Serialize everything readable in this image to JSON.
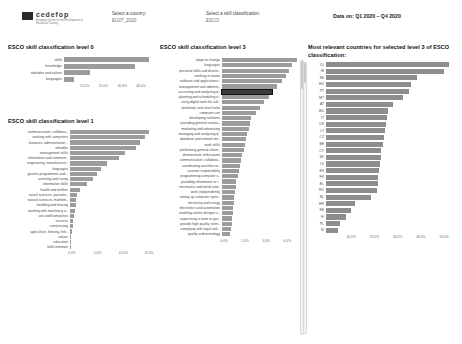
{
  "header": {
    "logo_word": "cedefop",
    "logo_sub": "European Centre for the Development of Vocational Training",
    "country_select": {
      "label": "Select a country:",
      "value": "EU27_2020"
    },
    "class_select": {
      "label": "Select a skill classification:",
      "value": "ESCO"
    },
    "data_on": "Data on: Q1 2020 – Q4 2020"
  },
  "panels": {
    "level0_title": "ESCO skill classification level 0",
    "level1_title": "ESCO skill classification level 1",
    "level3_title": "ESCO skill classification level 3",
    "countries_title": "Most relevant countries for selected level 3 of ESCO classification:"
  },
  "chart_data": [
    {
      "id": "level0",
      "type": "bar",
      "orientation": "horizontal",
      "title": "ESCO skill classification level 0",
      "xlabel": "",
      "ylabel": "",
      "xlim": [
        0,
        47
      ],
      "grid": false,
      "ticks": [
        "10.0%",
        "20.0%",
        "30.0%",
        "40.0%"
      ],
      "tick_values": [
        10,
        20,
        30,
        40
      ],
      "categories": [
        "skills",
        "knowledge",
        "attitudes and values",
        "languages"
      ],
      "values": [
        44.5,
        37.0,
        13.5,
        5.0
      ]
    },
    {
      "id": "level1",
      "type": "bar",
      "orientation": "horizontal",
      "title": "ESCO skill classification level 1",
      "xlabel": "",
      "ylabel": "",
      "xlim": [
        0,
        16
      ],
      "grid": false,
      "ticks": [
        "0.0%",
        "5.0%",
        "10.0%",
        "15.0%"
      ],
      "tick_values": [
        0,
        5,
        10,
        15
      ],
      "categories": [
        "communication, collabora..",
        "working with computers",
        "business, administration ..",
        "attitudes",
        "management skills",
        "information and communi..",
        "engineering, manufacturin..",
        "languages",
        "generic programmes and ..",
        "assisting and caring",
        "information skills",
        "health and welfare",
        "social sciences, journalis..",
        "natural sciences, mathem..",
        "handling and moving",
        "working with machinery a..",
        "arts and humanities",
        "services",
        "constructing",
        "agriculture, forestry, fish..",
        "values",
        "education",
        "field unknown"
      ],
      "values": [
        15.0,
        14.2,
        13.4,
        12.6,
        10.5,
        9.4,
        7.0,
        5.9,
        5.2,
        4.4,
        3.2,
        1.9,
        1.4,
        1.2,
        1.1,
        0.9,
        0.7,
        0.55,
        0.5,
        0.4,
        0.18,
        0.12,
        0.06
      ]
    },
    {
      "id": "level3",
      "type": "bar",
      "orientation": "horizontal",
      "title": "ESCO skill classification level 3",
      "xlabel": "",
      "ylabel": "",
      "xlim": [
        0,
        7.2
      ],
      "grid": false,
      "ticks": [
        "0.0%",
        "2.0%",
        "4.0%",
        "6.0%"
      ],
      "tick_values": [
        0,
        2,
        4,
        6
      ],
      "selected_index": 6,
      "categories": [
        "adapt to change",
        "languages",
        "personal skills and develo..",
        "working in teams",
        "software and applications..",
        "management and adminis..",
        "accessing and analysing d..",
        "planning and scheduling e..",
        "using digital tools for coll..",
        "wholesale and retail sales",
        "computer use",
        "developing solutions",
        "providing general assista..",
        "marketing and advertising",
        "managing and analysing d..",
        "database and network de..",
        "work skills",
        "performing general cleani..",
        "demonstrate enthusiasm",
        "communication, collabora..",
        "coordinating activities wi..",
        "assume responsibility",
        "programming computer s..",
        "providing information to t..",
        "mechanics and metal trad..",
        "work independently",
        "setting up computer syste..",
        "electricity and energy",
        "electronics and automation",
        "enabling artistic designs a..",
        "supervising a team or gro..",
        "provide high quality client..",
        "complying with legal and ..",
        "quality and metrology"
      ],
      "values": [
        6.9,
        6.5,
        6.2,
        5.9,
        5.5,
        5.1,
        4.6,
        4.3,
        3.9,
        3.5,
        3.1,
        2.7,
        2.6,
        2.5,
        2.3,
        2.2,
        2.1,
        2.0,
        1.85,
        1.75,
        1.7,
        1.6,
        1.45,
        1.3,
        1.25,
        1.2,
        1.15,
        1.1,
        1.05,
        1.0,
        0.95,
        0.9,
        0.8,
        0.75
      ]
    },
    {
      "id": "countries",
      "type": "bar",
      "orientation": "horizontal",
      "title": "Most relevant countries for selected level 3 of ESCO classification:",
      "xlabel": "",
      "ylabel": "",
      "xlim": [
        0,
        56
      ],
      "grid": false,
      "ticks": [
        "10.0%",
        "20.0%",
        "30.0%",
        "40.0%",
        "50.0%"
      ],
      "tick_values": [
        10,
        20,
        30,
        40,
        50
      ],
      "categories": [
        "LU",
        "IE",
        "SE",
        "HU",
        "PT",
        "MT",
        "AT",
        "BG",
        "IT",
        "DK",
        "LT",
        "CZ",
        "BE",
        "CY",
        "SK",
        "LV",
        "ES",
        "FR",
        "EL",
        "RO",
        "NL",
        "HR",
        "EE",
        "FI",
        "PL",
        "SI"
      ],
      "values": [
        52.0,
        50.0,
        38.5,
        36.0,
        35.0,
        32.5,
        28.5,
        26.5,
        26.0,
        25.5,
        25.0,
        24.5,
        24.0,
        23.5,
        23.2,
        23.0,
        22.5,
        22.2,
        22.0,
        21.8,
        19.0,
        12.5,
        10.5,
        8.5,
        6.0,
        5.0
      ]
    }
  ]
}
